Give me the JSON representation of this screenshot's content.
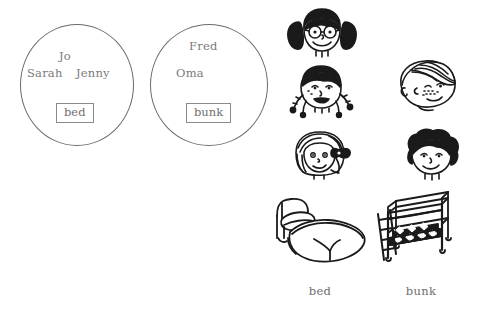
{
  "worksheet": {
    "type": "grouping-diagram",
    "background_color": "#ffffff",
    "ink_color": "#1a1a1a",
    "text_color": "#6f6f6f",
    "outline_color": "#6b6b6b"
  },
  "groups": [
    {
      "id": "bed-group",
      "label": "bed",
      "members": [
        "Jo",
        "Sarah",
        "Jenny"
      ],
      "member_count": 3
    },
    {
      "id": "bunk-group",
      "label": "bunk",
      "members": [
        "Fred",
        "Oma"
      ],
      "member_count": 2
    }
  ],
  "group_left": {
    "name_top": "Jo",
    "name_left": "Sarah",
    "name_right": "Jenny",
    "box_label": "bed"
  },
  "group_right": {
    "name_top": "Fred",
    "name_left": "Oma",
    "box_label": "bunk"
  },
  "faces": [
    {
      "id": "face-girl-glasses-pigtails",
      "icon": "girl-with-glasses-and-pigtails-icon",
      "column": "left",
      "row": 1
    },
    {
      "id": "face-child-braids",
      "icon": "child-with-braids-icon",
      "column": "left",
      "row": 2
    },
    {
      "id": "face-girl-bow",
      "icon": "girl-with-hair-bow-icon",
      "column": "left",
      "row": 3
    },
    {
      "id": "face-boy-freckles",
      "icon": "boy-with-freckles-icon",
      "column": "right",
      "row": 1
    },
    {
      "id": "face-boy-curly",
      "icon": "boy-with-curly-hair-icon",
      "column": "right",
      "row": 2
    }
  ],
  "furniture": [
    {
      "id": "bed-illustration",
      "icon": "single-bed-icon",
      "caption": "bed"
    },
    {
      "id": "bunk-illustration",
      "icon": "bunk-bed-icon",
      "caption": "bunk"
    }
  ],
  "captions": {
    "bed": "bed",
    "bunk": "bunk"
  }
}
